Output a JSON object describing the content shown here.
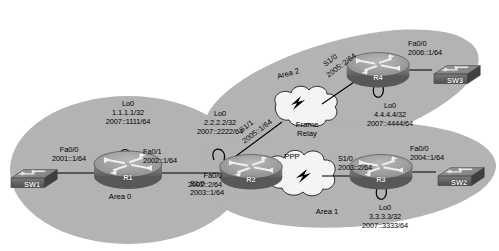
{
  "diagram": {
    "areas": [
      {
        "id": "area0",
        "label": "Area 0"
      },
      {
        "id": "area1",
        "label": "Area 1"
      },
      {
        "id": "area2",
        "label": "Area 2"
      }
    ],
    "clouds": [
      {
        "id": "frame-relay",
        "line1": "Frame",
        "line2": "Relay"
      },
      {
        "id": "ppp",
        "line1": "PPP",
        "line2": ""
      }
    ],
    "devices": [
      {
        "id": "sw1",
        "name": "SW1",
        "type": "switch"
      },
      {
        "id": "sw2",
        "name": "SW2",
        "type": "switch"
      },
      {
        "id": "sw3",
        "name": "SW3",
        "type": "switch"
      },
      {
        "id": "r1",
        "name": "R1",
        "type": "router"
      },
      {
        "id": "r2",
        "name": "R2",
        "type": "router"
      },
      {
        "id": "r3",
        "name": "R3",
        "type": "router"
      },
      {
        "id": "r4",
        "name": "R4",
        "type": "router"
      }
    ],
    "loopbacks": [
      {
        "id": "r1-lo0",
        "name": "Lo0",
        "ipv4": "1.1.1.1/32",
        "ipv6": "2007::1111/64"
      },
      {
        "id": "r2-lo0",
        "name": "Lo0",
        "ipv4": "2.2.2.2/32",
        "ipv6": "2007::2222/64"
      },
      {
        "id": "r3-lo0",
        "name": "Lo0",
        "ipv4": "3.3.3.3/32",
        "ipv6": "2007::3333/64"
      },
      {
        "id": "r4-lo0",
        "name": "Lo0",
        "ipv4": "4.4.4.4/32",
        "ipv6": "2007::4444/64"
      }
    ],
    "interfaces": [
      {
        "id": "r1-fa00",
        "name": "Fa0/0",
        "ipv6": "2001::1/64"
      },
      {
        "id": "r1-fa01",
        "name": "Fa0/1",
        "ipv6": "2002::1/64"
      },
      {
        "id": "r2-fa00",
        "name": "Fa0/0",
        "ipv6": "2002::2/64"
      },
      {
        "id": "r2-s11",
        "name": "S1/1",
        "ipv6": "2005::1/64"
      },
      {
        "id": "r2-s10",
        "name": "S1/0",
        "ipv6": "2003::1/64"
      },
      {
        "id": "r4-s10",
        "name": "S1/0",
        "ipv6": "2005::2/64"
      },
      {
        "id": "r4-fa00",
        "name": "Fa0/0",
        "ipv6": "2006::1/64"
      },
      {
        "id": "r3-s10",
        "name": "S1/0",
        "ipv6": "2003::2/64"
      },
      {
        "id": "r3-fa00",
        "name": "Fa0/0",
        "ipv6": "2004::1/64"
      }
    ],
    "colors": {
      "area_fill": "#b3b3b3",
      "cloud_fill": "#f2f2f2",
      "cloud_stroke": "#000000",
      "device_body": "#9a9a9a",
      "device_dark": "#6e6e6e",
      "link": "#000000",
      "background": "#ffffff"
    }
  }
}
